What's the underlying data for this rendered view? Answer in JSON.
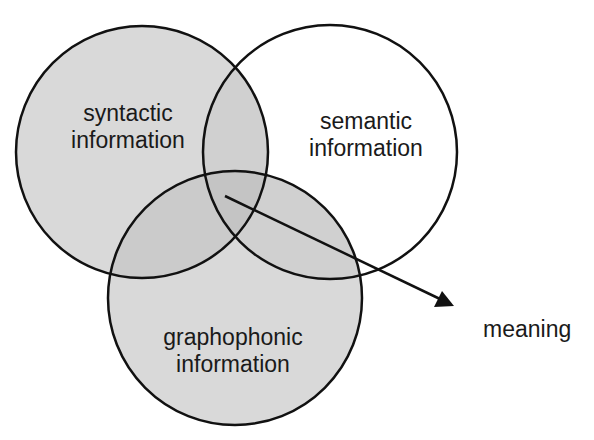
{
  "diagram": {
    "type": "venn",
    "circles": [
      {
        "id": "syntactic",
        "line1": "syntactic",
        "line2": "information",
        "cx": 142,
        "cy": 152,
        "r": 126,
        "fill": "#d9d9d9"
      },
      {
        "id": "semantic",
        "line1": "semantic",
        "line2": "information",
        "cx": 330,
        "cy": 152,
        "r": 127,
        "fill": "none"
      },
      {
        "id": "graphophonic",
        "line1": "graphophonic",
        "line2": "information",
        "cx": 235,
        "cy": 298,
        "r": 127,
        "fill": "#d9d9d9"
      }
    ],
    "arrow": {
      "from": [
        225,
        196
      ],
      "to": [
        452,
        305
      ],
      "label": "meaning"
    },
    "colors": {
      "stroke": "#111111",
      "fill": "#d9d9d9",
      "overlap": "#c6c6c6",
      "background": "#ffffff"
    }
  }
}
